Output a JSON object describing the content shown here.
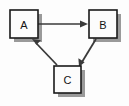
{
  "diagram": {
    "type": "directed-graph",
    "title": "",
    "background_color": "#fdfdfd",
    "node_fill_color": "#fcfcfc",
    "node_border_color": "#1a1a1a",
    "shadow_color": "#9a9a9a",
    "edge_color": "#3a3a3a",
    "label_color": "#141414",
    "nodes": [
      {
        "id": "A",
        "label": "A",
        "x": 10,
        "y": 10,
        "width": 28,
        "height": 28
      },
      {
        "id": "B",
        "label": "B",
        "x": 89,
        "y": 10,
        "width": 28,
        "height": 28
      },
      {
        "id": "C",
        "label": "C",
        "x": 54,
        "y": 66,
        "width": 27,
        "height": 27
      }
    ],
    "edges": [
      {
        "id": "edge-a-b",
        "from": "A",
        "to": "B",
        "label": "",
        "directed": true,
        "x1": 38,
        "y1": 24,
        "x2": 88,
        "y2": 24
      },
      {
        "id": "edge-b-c",
        "from": "B",
        "to": "C",
        "label": "",
        "directed": true,
        "x1": 96,
        "y1": 39,
        "x2": 79,
        "y2": 66
      },
      {
        "id": "edge-c-a",
        "from": "C",
        "to": "A",
        "label": "",
        "directed": true,
        "x1": 57,
        "y1": 65,
        "x2": 32,
        "y2": 39
      }
    ]
  }
}
